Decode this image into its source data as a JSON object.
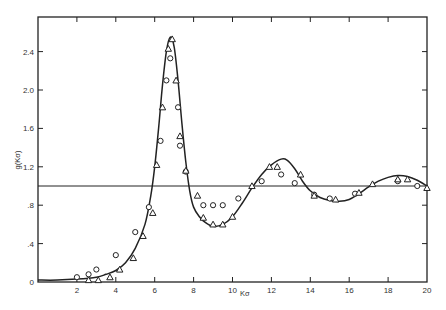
{
  "chart_data": {
    "type": "scatter",
    "title": "",
    "xlabel": "Kσ",
    "ylabel": "g(Kσ)",
    "xlim": [
      0,
      20
    ],
    "ylim": [
      0,
      2.7
    ],
    "grid": false,
    "legend": null,
    "x_ticks": [
      0,
      2,
      4,
      6,
      8,
      10,
      12,
      14,
      16,
      18,
      20
    ],
    "x_tick_labels": [
      "0",
      "2",
      "4",
      "6",
      "8",
      "10",
      "12",
      "14",
      "16",
      "18",
      "20"
    ],
    "y_ticks": [
      0,
      0.4,
      0.8,
      1.2,
      1.6,
      2.0,
      2.4
    ],
    "y_tick_labels": [
      "0",
      ".4",
      ".8",
      "1.2",
      "1.6",
      "2.0",
      "2.4"
    ],
    "reference_line": {
      "y": 1.0,
      "label": ""
    },
    "series": [
      {
        "name": "theory curve",
        "kind": "line",
        "x": [
          0,
          1,
          2,
          3,
          3.5,
          4,
          4.5,
          5,
          5.5,
          5.8,
          6.0,
          6.2,
          6.4,
          6.6,
          6.8,
          7.0,
          7.2,
          7.4,
          7.6,
          7.8,
          8.0,
          8.3,
          8.6,
          9.0,
          9.5,
          10.0,
          10.5,
          11.0,
          11.5,
          12.0,
          12.5,
          12.8,
          13.2,
          13.6,
          14.0,
          14.5,
          15.0,
          15.5,
          16.0,
          16.5,
          17.0,
          17.5,
          18.0,
          18.5,
          19.0,
          19.5,
          20.0
        ],
        "y": [
          0.02,
          0.02,
          0.03,
          0.05,
          0.08,
          0.12,
          0.2,
          0.35,
          0.6,
          0.9,
          1.2,
          1.6,
          2.05,
          2.4,
          2.55,
          2.45,
          2.1,
          1.65,
          1.25,
          0.95,
          0.78,
          0.68,
          0.62,
          0.58,
          0.6,
          0.68,
          0.82,
          0.98,
          1.12,
          1.22,
          1.28,
          1.27,
          1.18,
          1.05,
          0.95,
          0.88,
          0.85,
          0.84,
          0.86,
          0.92,
          0.99,
          1.05,
          1.09,
          1.11,
          1.1,
          1.06,
          1.0
        ]
      },
      {
        "name": "circles",
        "kind": "scatter",
        "marker": "circle",
        "x": [
          2.0,
          2.6,
          3.0,
          4.0,
          5.0,
          5.7,
          6.3,
          6.6,
          6.8,
          7.2,
          7.3,
          7.6,
          8.5,
          9.0,
          9.5,
          10.3,
          11.5,
          12.5,
          13.2,
          14.2,
          15.0,
          16.3,
          18.5,
          19.5
        ],
        "y": [
          0.05,
          0.08,
          0.13,
          0.28,
          0.52,
          0.78,
          1.47,
          2.1,
          2.33,
          1.82,
          1.42,
          1.15,
          0.8,
          0.8,
          0.8,
          0.87,
          1.05,
          1.12,
          1.03,
          0.91,
          0.87,
          0.92,
          1.05,
          1.0
        ]
      },
      {
        "name": "triangles",
        "kind": "scatter",
        "marker": "triangle",
        "x": [
          2.6,
          3.1,
          3.7,
          4.2,
          4.9,
          5.4,
          5.9,
          6.1,
          6.4,
          6.7,
          6.9,
          7.1,
          7.3,
          7.6,
          8.2,
          8.5,
          9.0,
          9.5,
          10.0,
          11.0,
          11.9,
          12.3,
          13.5,
          14.2,
          15.3,
          16.5,
          17.2,
          18.5,
          19.0,
          20.0
        ],
        "y": [
          0.02,
          0.02,
          0.05,
          0.13,
          0.25,
          0.48,
          0.72,
          1.22,
          1.82,
          2.43,
          2.53,
          2.1,
          1.52,
          1.16,
          0.9,
          0.67,
          0.6,
          0.6,
          0.68,
          1.0,
          1.2,
          1.2,
          1.12,
          0.9,
          0.86,
          0.93,
          1.02,
          1.07,
          1.07,
          0.98
        ]
      }
    ]
  }
}
